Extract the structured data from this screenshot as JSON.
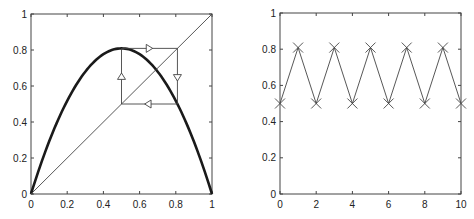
{
  "figure": {
    "width": 474,
    "height": 219,
    "background": "#ffffff",
    "line_color": "#444444",
    "curve_color": "#1a1a1a"
  },
  "chart_data": [
    {
      "type": "line",
      "title": "",
      "description": "Cobweb diagram of logistic map showing a superstable period-2 cycle",
      "xlabel": "",
      "ylabel": "",
      "xlim": [
        0,
        1
      ],
      "ylim": [
        0,
        1
      ],
      "xticks": [
        0,
        0.2,
        0.4,
        0.6,
        0.8,
        1
      ],
      "yticks": [
        0,
        0.2,
        0.4,
        0.6,
        0.8,
        1
      ],
      "xtick_labels": [
        "0",
        "0.2",
        "0.4",
        "0.6",
        "0.8",
        "1"
      ],
      "ytick_labels": [
        "0",
        "0.2",
        "0.4",
        "0.6",
        "0.8",
        "1"
      ],
      "grid": false,
      "box": true,
      "series": [
        {
          "name": "logistic map f(x) = r x (1 - x)",
          "style": "thick solid",
          "r": 3.236,
          "x": [
            0,
            0.1,
            0.2,
            0.3,
            0.4,
            0.5,
            0.6,
            0.7,
            0.8,
            0.9,
            1
          ],
          "y": [
            0,
            0.291,
            0.518,
            0.68,
            0.777,
            0.809,
            0.777,
            0.68,
            0.518,
            0.291,
            0
          ]
        },
        {
          "name": "diagonal y = x",
          "style": "thin solid",
          "x": [
            0,
            1
          ],
          "y": [
            0,
            1
          ]
        },
        {
          "name": "cobweb cycle",
          "style": "thin solid with triangle arrows",
          "x": [
            0.5,
            0.5,
            0.809,
            0.809,
            0.5
          ],
          "y": [
            0.5,
            0.809,
            0.809,
            0.5,
            0.5
          ]
        }
      ],
      "annotations": [
        {
          "type": "arrow",
          "direction": "up",
          "x": 0.5,
          "y": 0.65
        },
        {
          "type": "arrow",
          "direction": "right",
          "x": 0.65,
          "y": 0.809
        },
        {
          "type": "arrow",
          "direction": "down",
          "x": 0.809,
          "y": 0.65
        },
        {
          "type": "arrow",
          "direction": "left",
          "x": 0.65,
          "y": 0.5
        }
      ]
    },
    {
      "type": "line",
      "title": "",
      "description": "Time series of iterates x_n alternating on period-2 cycle",
      "xlabel": "",
      "ylabel": "",
      "xlim": [
        0,
        10
      ],
      "ylim": [
        0,
        1
      ],
      "xticks": [
        0,
        2,
        4,
        6,
        8,
        10
      ],
      "yticks": [
        0,
        0.2,
        0.4,
        0.6,
        0.8,
        1
      ],
      "xtick_labels": [
        "0",
        "2",
        "4",
        "6",
        "8",
        "10"
      ],
      "ytick_labels": [
        "0",
        "0.2",
        "0.4",
        "0.6",
        "0.8",
        "1"
      ],
      "grid": false,
      "box": true,
      "series": [
        {
          "name": "x_n",
          "marker": "x",
          "style": "thin solid with x markers",
          "x": [
            0,
            1,
            2,
            3,
            4,
            5,
            6,
            7,
            8,
            9,
            10
          ],
          "y": [
            0.5,
            0.809,
            0.5,
            0.809,
            0.5,
            0.809,
            0.5,
            0.809,
            0.5,
            0.809,
            0.5
          ]
        }
      ]
    }
  ],
  "layout": {
    "panels": [
      {
        "left": 31,
        "top": 14,
        "right": 212,
        "bottom": 194
      },
      {
        "left": 280,
        "top": 13,
        "right": 461,
        "bottom": 194
      }
    ]
  }
}
